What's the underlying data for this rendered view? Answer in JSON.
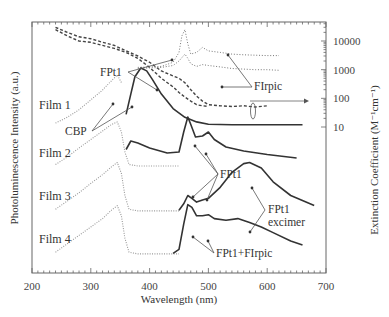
{
  "chart_data": {
    "type": "line",
    "title": "",
    "xlabel": "Wavelength (nm)",
    "ylabel_left": "Photoluminescence Intensity (a.u.)",
    "ylabel_right": "Extinction Coefficient (M⁻¹cm⁻¹)",
    "xlim": [
      200,
      700
    ],
    "x_ticks": [
      200,
      300,
      400,
      500,
      600,
      700
    ],
    "y_right_scale": "log",
    "y_right_lim": [
      1,
      30000
    ],
    "y_right_ticks": [
      10,
      100,
      1000,
      10000
    ],
    "grid": false,
    "absorption_series": [
      {
        "name": "FPt1 absorption (dashed)",
        "style": "dashed",
        "x": [
          240,
          260,
          280,
          300,
          320,
          340,
          360,
          380,
          400,
          420,
          440,
          450,
          460,
          470,
          480,
          490,
          500,
          520,
          540,
          560,
          580,
          600
        ],
        "y": [
          30000,
          20000,
          14000,
          12000,
          9000,
          7000,
          4500,
          3000,
          1800,
          900,
          600,
          500,
          350,
          200,
          120,
          80,
          60,
          55,
          52,
          55,
          50,
          55
        ]
      },
      {
        "name": "FPt1 absorption (second dashed)",
        "style": "dashed",
        "x": [
          240,
          260,
          280,
          300,
          320,
          340,
          360,
          380,
          400,
          420,
          440,
          450,
          460,
          470,
          480,
          490,
          500
        ],
        "y": [
          25000,
          15000,
          10000,
          9000,
          7000,
          5500,
          4000,
          2500,
          1200,
          500,
          250,
          160,
          110,
          80,
          60,
          55,
          52
        ]
      },
      {
        "name": "FIrpic absorption (dotted, upper)",
        "style": "dotted",
        "x": [
          380,
          420,
          440,
          450,
          455,
          460,
          465,
          470,
          480,
          490,
          500,
          520,
          540,
          560,
          580,
          600,
          620
        ],
        "y": [
          1200,
          1300,
          1800,
          4000,
          15000,
          25000,
          8000,
          3500,
          4000,
          6000,
          4500,
          4000,
          3500,
          3300,
          3200,
          3100,
          3100
        ]
      },
      {
        "name": "FIrpic absorption (dotted, lower)",
        "style": "dotted",
        "x": [
          380,
          420,
          440,
          450,
          460,
          465,
          470,
          480,
          490,
          500,
          520,
          540,
          560,
          580,
          600,
          620
        ],
        "y": [
          1100,
          1200,
          1400,
          2000,
          3500,
          2500,
          1600,
          1300,
          1500,
          1400,
          1250,
          1100,
          1050,
          1000,
          1000,
          950
        ]
      }
    ],
    "pl_series": [
      {
        "film": "Film 1",
        "components": [
          {
            "name": "CBP",
            "style": "dotted",
            "x": [
              240,
              260,
              280,
              300,
              320,
              335,
              345,
              352
            ],
            "y": [
              0.05,
              0.15,
              0.28,
              0.45,
              0.62,
              0.78,
              0.88,
              0.75
            ]
          },
          {
            "name": "Film 1 PL",
            "style": "solid",
            "x": [
              360,
              368,
              375,
              385,
              395,
              405,
              420,
              440,
              460,
              480,
              500,
              540,
              580,
              620,
              660
            ],
            "y": [
              0.2,
              0.55,
              0.85,
              1.0,
              0.95,
              0.8,
              0.55,
              0.3,
              0.15,
              0.07,
              0.03,
              0.02,
              0.02,
              0.02,
              0.02
            ]
          }
        ]
      },
      {
        "film": "Film 2",
        "components": [
          {
            "name": "CBP",
            "style": "dotted",
            "x": [
              240,
              260,
              280,
              300,
              320,
              335,
              345,
              352,
              358,
              365,
              380,
              420,
              450
            ],
            "y": [
              0.05,
              0.2,
              0.38,
              0.55,
              0.72,
              0.85,
              0.9,
              0.7,
              0.3,
              0.05,
              0.02,
              0.02,
              0.02
            ]
          },
          {
            "name": "Film 2 PL",
            "style": "solid",
            "x": [
              360,
              368,
              380,
              400,
              430,
              450,
              458,
              465,
              470,
              478,
              490,
              500,
              510,
              530,
              560,
              600,
              650
            ],
            "y": [
              0.35,
              0.52,
              0.48,
              0.38,
              0.28,
              0.3,
              0.7,
              1.0,
              0.85,
              0.6,
              0.62,
              0.7,
              0.55,
              0.4,
              0.32,
              0.25,
              0.18
            ]
          }
        ]
      },
      {
        "film": "Film 3",
        "components": [
          {
            "name": "CBP",
            "style": "dotted",
            "x": [
              240,
              260,
              280,
              300,
              320,
              335,
              345,
              352,
              358,
              365,
              380,
              420,
              450
            ],
            "y": [
              0.05,
              0.2,
              0.35,
              0.52,
              0.68,
              0.82,
              0.9,
              0.7,
              0.3,
              0.05,
              0.02,
              0.02,
              0.02
            ]
          },
          {
            "name": "Film 3 PL",
            "style": "solid",
            "x": [
              450,
              458,
              465,
              472,
              480,
              490,
              500,
              520,
              540,
              560,
              570,
              590,
              610,
              640,
              680
            ],
            "y": [
              0.03,
              0.15,
              0.3,
              0.25,
              0.18,
              0.22,
              0.25,
              0.45,
              0.72,
              0.88,
              0.9,
              0.8,
              0.55,
              0.3,
              0.12
            ]
          }
        ]
      },
      {
        "film": "Film 4",
        "components": [
          {
            "name": "CBP",
            "style": "dotted",
            "x": [
              240,
              260,
              280,
              300,
              320,
              335,
              345,
              352,
              358,
              365,
              380,
              420,
              450
            ],
            "y": [
              0.05,
              0.2,
              0.35,
              0.5,
              0.65,
              0.8,
              0.88,
              0.7,
              0.3,
              0.05,
              0.02,
              0.02,
              0.02
            ]
          },
          {
            "name": "Film 4 PL",
            "style": "solid",
            "x": [
              440,
              450,
              458,
              465,
              472,
              480,
              490,
              500,
              510,
              530,
              550,
              570,
              590,
              610,
              640,
              660
            ],
            "y": [
              0.03,
              0.1,
              0.55,
              0.9,
              0.85,
              0.7,
              0.7,
              0.72,
              0.65,
              0.62,
              0.65,
              0.58,
              0.5,
              0.4,
              0.25,
              0.18
            ]
          }
        ]
      }
    ],
    "film_labels": [
      "Film 1",
      "Film 2",
      "Film 3",
      "Film 4"
    ],
    "annotations": [
      {
        "id": "fpt1-abs",
        "text": "FPt1",
        "x_nm": 290
      },
      {
        "id": "firpic-abs",
        "text": "FIrpic",
        "x_nm": 480
      },
      {
        "id": "cbp",
        "text": "CBP",
        "x_nm": 250
      },
      {
        "id": "fpt1-film2",
        "text": "FPt1",
        "x_nm": 510
      },
      {
        "id": "fpt1-excimer-1",
        "text": "FPt1",
        "x_nm": 610
      },
      {
        "id": "fpt1-excimer-2",
        "text": "excimer",
        "x_nm": 610
      },
      {
        "id": "fpt1-firpic",
        "text": "FPt1+FIrpic",
        "x_nm": 510
      }
    ]
  }
}
